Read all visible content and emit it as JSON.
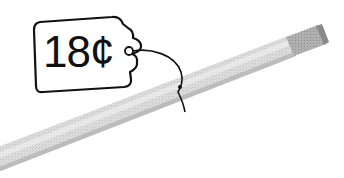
{
  "illustration": {
    "subject": "pencil with price tag",
    "price_tag": {
      "label": "18¢"
    },
    "colors": {
      "outline": "#111111",
      "pencil_body": "#d9d9d9",
      "pencil_shade": "#b8b8b8",
      "ferrule": "#a8a8a8",
      "background": "#ffffff"
    }
  }
}
